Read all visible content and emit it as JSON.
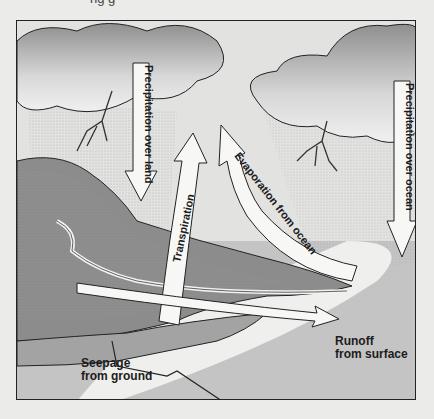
{
  "diagram": {
    "title_cutoff": "ng g",
    "labels": {
      "precipitation_land": "Precipitation over land",
      "precipitation_ocean": "Precipitation over ocean",
      "transpiration": "Transpiration",
      "evaporation": "Evaporation from ocean",
      "runoff_line1": "Runoff",
      "runoff_line2": "from surface",
      "seepage_line1": "Seepage",
      "seepage_line2": "from ground"
    },
    "colors": {
      "page_bg": "#ebebe9",
      "sky": "#e2e2e0",
      "cloud_dark": "#9a9a9a",
      "cloud_light": "#f2f2f2",
      "land": "#8c8c8c",
      "forest": "#6f6f6f",
      "ocean": "#c4c4c4",
      "beach": "#efefed",
      "arrow_fill": "#f7f7f5",
      "stroke": "#222222"
    }
  }
}
